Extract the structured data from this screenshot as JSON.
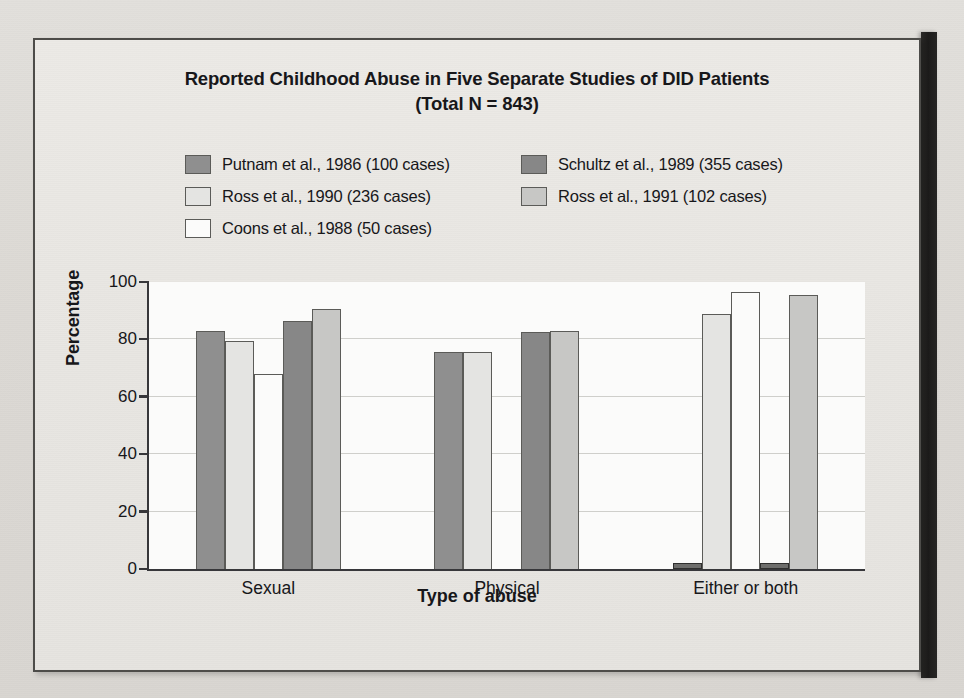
{
  "figure": {
    "title_line_1": "Reported Childhood Abuse in Five Separate Studies of DID Patients",
    "title_line_2": "(Total N = 843)"
  },
  "legend": {
    "items": [
      {
        "label": "Putnam et al., 1986 (100 cases)",
        "color": "#8f8f8f"
      },
      {
        "label": "Schultz et al., 1989 (355 cases)",
        "color": "#878787"
      },
      {
        "label": "Ross et al., 1990 (236 cases)",
        "color": "#e4e4e2"
      },
      {
        "label": "Ross et al., 1991 (102 cases)",
        "color": "#c7c7c5"
      },
      {
        "label": "Coons et al., 1988 (50 cases)",
        "color": "#fbfbfa"
      }
    ]
  },
  "axes": {
    "y_ticks": [
      "0",
      "20",
      "40",
      "60",
      "80",
      "100"
    ],
    "x_ticks": [
      "Sexual",
      "Physical",
      "Either or both"
    ],
    "ylabel": "Percentage",
    "xlabel": "Type of abuse"
  },
  "chart_data": {
    "type": "bar",
    "title": "Reported Childhood Abuse in Five Separate Studies of DID Patients (Total N = 843)",
    "xlabel": "Type of abuse",
    "ylabel": "Percentage",
    "ylim": [
      0,
      100
    ],
    "ytick_step": 20,
    "grid": true,
    "legend_position": "above-plot",
    "categories": [
      "Sexual",
      "Physical",
      "Either or both"
    ],
    "series": [
      {
        "name": "Putnam et al., 1986 (100 cases)",
        "color": "#8f8f8f",
        "values": [
          83,
          75.5,
          2
        ]
      },
      {
        "name": "Ross et al., 1990 (236 cases)",
        "color": "#e4e4e2",
        "values": [
          79.5,
          75.5,
          89
        ]
      },
      {
        "name": "Coons et al., 1988 (50 cases)",
        "color": "#fbfbfa",
        "values": [
          68,
          0,
          96.5
        ]
      },
      {
        "name": "Schultz et al., 1989 (355 cases)",
        "color": "#878787",
        "values": [
          86.5,
          82.5,
          2
        ]
      },
      {
        "name": "Ross et al., 1991 (102 cases)",
        "color": "#c7c7c5",
        "values": [
          90.5,
          83,
          95.5
        ]
      }
    ]
  }
}
